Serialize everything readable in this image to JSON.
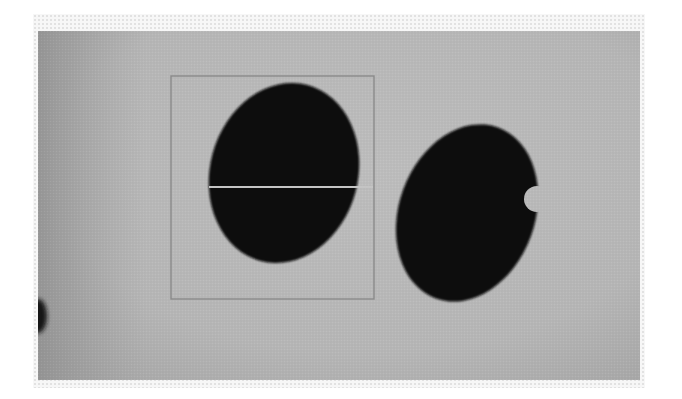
{
  "image": {
    "description": "Grayscale photograph of two dark seed-like objects on a gray background; left object enclosed by a rectangular bounding box with a horizontal measurement line across it",
    "colors": {
      "background": "#b9b9b9",
      "background_dark_edge": "#9a9a9a",
      "object": "#0d0d0d",
      "box_stroke": "#8a8a8a",
      "measure_line": "#c4c4c4",
      "frame": "#e2e2e2"
    },
    "objects": [
      {
        "id": "left-seed",
        "label": "seed",
        "shape": "ellipse",
        "bounded": true
      },
      {
        "id": "right-seed",
        "label": "seed",
        "shape": "ellipse-with-notch",
        "bounded": false
      },
      {
        "id": "edge-blob",
        "label": "partial dark object at left edge",
        "shape": "partial"
      }
    ],
    "annotations": {
      "bounding_box": {
        "x": 171,
        "y": 76,
        "width": 203,
        "height": 223
      },
      "measure_line": {
        "x1": 209,
        "y1": 187,
        "x2": 373,
        "y2": 187
      }
    }
  }
}
